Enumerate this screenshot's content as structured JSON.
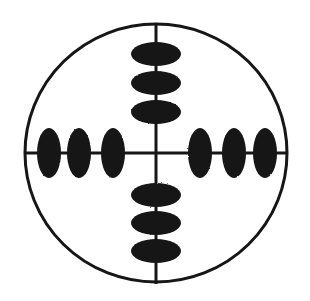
{
  "figure": {
    "background_color": "#ffffff",
    "ink_color": "#141414",
    "width": 310,
    "height": 301
  },
  "chart_data": {
    "type": "scatter",
    "subtitle": "",
    "xlabel": "",
    "ylabel": "",
    "grid": false,
    "legend_position": "none",
    "axis_center": {
      "x": 156,
      "y": 153
    },
    "xlim": [
      24,
      287
    ],
    "ylim": [
      25,
      284
    ],
    "boundary": {
      "shape": "circle",
      "center_x": 156,
      "center_y": 153,
      "radius_x": 131,
      "radius_y": 129,
      "stroke_width": 3,
      "fill": "none"
    },
    "axes": [
      {
        "name": "vertical-axis",
        "orientation": "vertical",
        "x1": 156,
        "y1": 25,
        "x2": 156,
        "y2": 284,
        "stroke_width": 3
      },
      {
        "name": "horizontal-axis",
        "orientation": "horizontal",
        "x1": 25,
        "y1": 153,
        "x2": 287,
        "y2": 153,
        "stroke_width": 3
      }
    ],
    "series": [
      {
        "name": "up-markers",
        "arm": "up",
        "orientation": "wide-flat",
        "count": 3,
        "marker_rx": 25,
        "marker_ry": 12,
        "points": [
          {
            "index": 1,
            "cx": 156,
            "cy": 54,
            "offset": -99
          },
          {
            "index": 2,
            "cx": 156,
            "cy": 83,
            "offset": -70
          },
          {
            "index": 3,
            "cx": 156,
            "cy": 112,
            "offset": -41
          }
        ]
      },
      {
        "name": "down-markers",
        "arm": "down",
        "orientation": "wide-flat",
        "count": 3,
        "marker_rx": 25,
        "marker_ry": 12,
        "points": [
          {
            "index": 1,
            "cx": 156,
            "cy": 195,
            "offset": 42
          },
          {
            "index": 2,
            "cx": 156,
            "cy": 223,
            "offset": 70
          },
          {
            "index": 3,
            "cx": 156,
            "cy": 251,
            "offset": 98
          }
        ]
      },
      {
        "name": "left-markers",
        "arm": "left",
        "orientation": "tall-narrow",
        "count": 3,
        "marker_rx": 12,
        "marker_ry": 25,
        "points": [
          {
            "index": 1,
            "cx": 113,
            "cy": 153,
            "offset": -43
          },
          {
            "index": 2,
            "cx": 79,
            "cy": 153,
            "offset": -77
          },
          {
            "index": 3,
            "cx": 49,
            "cy": 153,
            "offset": -107
          }
        ]
      },
      {
        "name": "right-markers",
        "arm": "right",
        "orientation": "tall-narrow",
        "count": 3,
        "marker_rx": 12,
        "marker_ry": 25,
        "points": [
          {
            "index": 1,
            "cx": 200,
            "cy": 153,
            "offset": 44
          },
          {
            "index": 2,
            "cx": 234,
            "cy": 153,
            "offset": 78
          },
          {
            "index": 3,
            "cx": 265,
            "cy": 153,
            "offset": 109
          }
        ]
      }
    ],
    "annotations": []
  }
}
